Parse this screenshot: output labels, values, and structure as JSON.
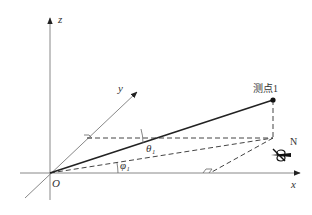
{
  "diagram": {
    "type": "3d-coordinate-geometry",
    "axes": {
      "x_label": "x",
      "y_label": "y",
      "z_label": "z",
      "origin_label": "O"
    },
    "point": {
      "label": "测点1"
    },
    "angles": {
      "theta_label": "θ₁",
      "phi_label": "φ₁"
    },
    "compass": {
      "label": "N",
      "icon": "north-arrow-icon"
    },
    "colors": {
      "axis": "#888888",
      "vector": "#222222",
      "dashed": "#444444",
      "text": "#333333"
    }
  }
}
